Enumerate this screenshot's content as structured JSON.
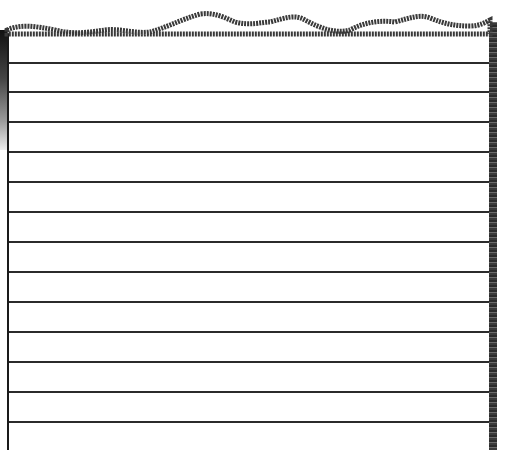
{
  "image": {
    "subject": "torn sheet of lined notebook paper",
    "colors": {
      "background": "#ffffff",
      "line": "#2b2b2b",
      "edge": "#3a3a3a"
    },
    "rule_positions_y": [
      62,
      91,
      121,
      151,
      181,
      211,
      241,
      271,
      301,
      331,
      361,
      391,
      421
    ]
  }
}
